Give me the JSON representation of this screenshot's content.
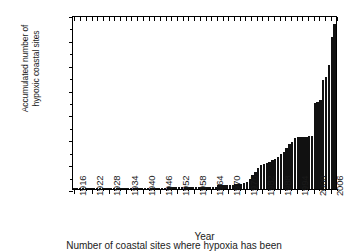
{
  "chart_data": {
    "type": "bar",
    "title": "",
    "xlabel": "Year",
    "ylabel": "Accumulated number of hypoxic coastal sites",
    "ylabel_line1": "Accumulated number of",
    "ylabel_line2": "hypoxic coastal sites",
    "caption": "Number of coastal sites where hypoxia has been",
    "grid": false,
    "legend": "none",
    "bar_color": "#111111",
    "ylim": [
      0,
      140
    ],
    "yticks": [
      0,
      20,
      40,
      60,
      80,
      100,
      120,
      140
    ],
    "ytick_labels": [
      "0",
      "20",
      "40",
      "60",
      "80",
      "100",
      "120",
      "140"
    ],
    "xlim": [
      1915,
      2009
    ],
    "xticks": [
      1916,
      1922,
      1928,
      1934,
      1940,
      1946,
      1952,
      1958,
      1964,
      1970,
      1976,
      1982,
      1988,
      1994,
      2000,
      2006
    ],
    "xtick_labels": [
      "1916",
      "1922",
      "1928",
      "1934",
      "1940",
      "1946",
      "1952",
      "1958",
      "1964",
      "1970",
      "1976",
      "1982",
      "1988",
      "1994",
      "2000",
      "2006"
    ],
    "categories": [
      1916,
      1917,
      1918,
      1919,
      1920,
      1921,
      1922,
      1923,
      1924,
      1925,
      1926,
      1927,
      1928,
      1929,
      1930,
      1931,
      1932,
      1933,
      1934,
      1935,
      1936,
      1937,
      1938,
      1939,
      1940,
      1941,
      1942,
      1943,
      1944,
      1945,
      1946,
      1947,
      1948,
      1949,
      1950,
      1951,
      1952,
      1953,
      1954,
      1955,
      1956,
      1957,
      1958,
      1959,
      1960,
      1961,
      1962,
      1963,
      1964,
      1965,
      1966,
      1967,
      1968,
      1969,
      1970,
      1971,
      1972,
      1973,
      1974,
      1975,
      1976,
      1977,
      1978,
      1979,
      1980,
      1981,
      1982,
      1983,
      1984,
      1985,
      1986,
      1987,
      1988,
      1989,
      1990,
      1991,
      1992,
      1993,
      1994,
      1995,
      1996,
      1997,
      1998,
      1999,
      2000,
      2001,
      2002,
      2003,
      2004,
      2005,
      2006,
      2007,
      2008
    ],
    "values": [
      1,
      1,
      1,
      1,
      1,
      1,
      1,
      1,
      1,
      1,
      1,
      1,
      1,
      1,
      1,
      1,
      1,
      1,
      1,
      1,
      1,
      1,
      1,
      1,
      1,
      1,
      1,
      1,
      1,
      1,
      1,
      1,
      1,
      2,
      2,
      2,
      2,
      2,
      2,
      2,
      2,
      2,
      2,
      2,
      2,
      2,
      2,
      2,
      2,
      2,
      2,
      3,
      3,
      3,
      3,
      3,
      3,
      4,
      4,
      4,
      5,
      6,
      8,
      11,
      14,
      17,
      19,
      20,
      21,
      22,
      23,
      24,
      26,
      28,
      30,
      33,
      36,
      38,
      41,
      42,
      42,
      42,
      42,
      43,
      43,
      69,
      70,
      72,
      88,
      90,
      100,
      122,
      133
    ],
    "series_name": "Accumulated hypoxic coastal sites"
  }
}
